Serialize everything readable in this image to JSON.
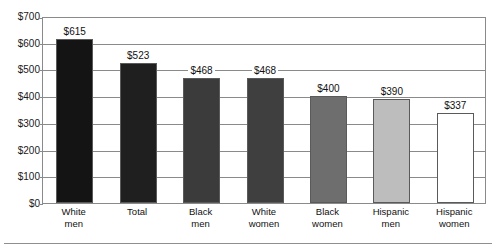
{
  "chart_data": {
    "type": "bar",
    "title": "",
    "subtitle": "",
    "xlabel": "",
    "ylabel": "",
    "ylim": [
      0,
      700
    ],
    "ytick_step": 100,
    "grid": true,
    "legend": "none",
    "currency_prefix": "$",
    "categories": [
      "White men",
      "Total",
      "Black men",
      "White women",
      "Black women",
      "Hispanic men",
      "Hispanic women"
    ],
    "category_lines": [
      [
        "White",
        "men"
      ],
      [
        "Total",
        ""
      ],
      [
        "Black",
        "men"
      ],
      [
        "White",
        "women"
      ],
      [
        "Black",
        "women"
      ],
      [
        "Hispanic",
        "men"
      ],
      [
        "Hispanic",
        "women"
      ]
    ],
    "values": [
      615,
      523,
      468,
      468,
      400,
      390,
      337
    ],
    "value_labels": [
      "$615",
      "$523",
      "$468",
      "$468",
      "$400",
      "$390",
      "$337"
    ],
    "bar_colors": [
      "#141414",
      "#1f1f1f",
      "#3b3b3b",
      "#3f3f3f",
      "#6e6e6e",
      "#bdbdbd",
      "#ffffff"
    ],
    "bar_border_color": "#5a5a5a",
    "ytick_labels": [
      "$0",
      "$100",
      "$200",
      "$300",
      "$400",
      "$500",
      "$600",
      "$700"
    ],
    "ytick_values": [
      0,
      100,
      200,
      300,
      400,
      500,
      600,
      700
    ],
    "grid_color": "#8a8a8a",
    "axis_color": "#8a8a8a",
    "text_color": "#111111",
    "background": "#ffffff"
  }
}
